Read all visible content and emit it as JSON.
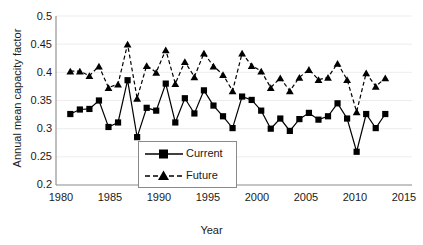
{
  "chart_data": {
    "type": "line",
    "title": "",
    "xlabel": "Year",
    "ylabel": "Annual mean capacity factor",
    "xlim": [
      1978.5,
      2015.8
    ],
    "ylim": [
      0.2,
      0.5
    ],
    "xticks": [
      1980,
      1985,
      1990,
      1995,
      2000,
      2005,
      2010,
      2015
    ],
    "yticks": [
      0.2,
      0.25,
      0.3,
      0.35,
      0.4,
      0.45,
      0.5
    ],
    "ytick_labels": [
      "0.2",
      "0.25",
      "0.3",
      "0.35",
      "0.4",
      "0.45",
      "0.5"
    ],
    "xtick_labels": [
      "1980",
      "1985",
      "1990",
      "1995",
      "2000",
      "2005",
      "2010",
      "2015"
    ],
    "grid": "horizontal",
    "legend_position": "inside-bottom-left",
    "x": [
      1980,
      1981,
      1982,
      1983,
      1984,
      1985,
      1986,
      1987,
      1988,
      1989,
      1990,
      1991,
      1992,
      1993,
      1994,
      1995,
      1996,
      1997,
      1998,
      1999,
      2000,
      2001,
      2002,
      2003,
      2004,
      2005,
      2006,
      2007,
      2008,
      2009,
      2010,
      2011,
      2012,
      2013
    ],
    "series": [
      {
        "name": "Current",
        "marker": "square",
        "line_style": "solid",
        "color": "#000000",
        "values": [
          0.326,
          0.334,
          0.335,
          0.35,
          0.303,
          0.311,
          0.386,
          0.285,
          0.337,
          0.332,
          0.38,
          0.311,
          0.354,
          0.327,
          0.368,
          0.341,
          0.322,
          0.301,
          0.357,
          0.351,
          0.332,
          0.3,
          0.318,
          0.296,
          0.317,
          0.328,
          0.316,
          0.322,
          0.345,
          0.318,
          0.259,
          0.326,
          0.301,
          0.326
        ]
      },
      {
        "name": "Future",
        "marker": "triangle",
        "line_style": "dashed",
        "color": "#000000",
        "values": [
          0.402,
          0.402,
          0.394,
          0.411,
          0.373,
          0.379,
          0.45,
          0.354,
          0.412,
          0.4,
          0.44,
          0.38,
          0.419,
          0.392,
          0.434,
          0.411,
          0.396,
          0.367,
          0.434,
          0.412,
          0.402,
          0.373,
          0.39,
          0.367,
          0.391,
          0.405,
          0.387,
          0.391,
          0.416,
          0.387,
          0.33,
          0.399,
          0.375,
          0.39
        ]
      }
    ]
  },
  "legend": {
    "items": [
      {
        "label": "Current"
      },
      {
        "label": "Future"
      }
    ]
  },
  "colors": {
    "axis": "#8a8a8a",
    "grid": "#ededed",
    "series": "#000000",
    "text": "#1a1a1a"
  }
}
